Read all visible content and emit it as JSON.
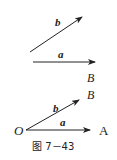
{
  "figure": {
    "caption": "图 7－43",
    "top": {
      "vector_b_label": "b",
      "vector_a_label": "a",
      "point_label": "B"
    },
    "bottom": {
      "origin_label": "O",
      "vector_b_label": "b",
      "vector_a_label": "a",
      "point_label": "A"
    }
  }
}
